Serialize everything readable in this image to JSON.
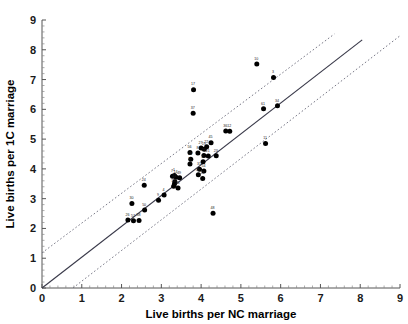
{
  "chart_data": {
    "type": "scatter",
    "title": "",
    "xlabel": "Live births per NC marriage",
    "ylabel": "Live births per 1C marriage",
    "xlim": [
      0,
      9
    ],
    "ylim": [
      0,
      9
    ],
    "xticks": [
      0,
      1,
      2,
      3,
      4,
      5,
      6,
      7,
      8,
      9
    ],
    "yticks": [
      0,
      1,
      2,
      3,
      4,
      5,
      6,
      7,
      8,
      9
    ],
    "xticklabels": [
      "0",
      "1",
      "2",
      "3",
      "4",
      "5",
      "6",
      "7",
      "8",
      "9"
    ],
    "yticklabels": [
      "0",
      "1",
      "2",
      "3",
      "4",
      "5",
      "6",
      "7",
      "8",
      "9"
    ],
    "minor_ticks_per_interval": 5,
    "grid": false,
    "legend": null,
    "marker": "filled-circle",
    "marker_color": "#000000",
    "point_label_position": "above-left",
    "points": [
      {
        "label": "10",
        "x": 5.4,
        "y": 7.52
      },
      {
        "label": "3",
        "x": 5.82,
        "y": 7.07
      },
      {
        "label": "17",
        "x": 3.81,
        "y": 6.66
      },
      {
        "label": "37",
        "x": 3.8,
        "y": 5.87
      },
      {
        "label": "61",
        "x": 5.57,
        "y": 6.02
      },
      {
        "label": "34",
        "x": 5.92,
        "y": 6.12
      },
      {
        "label": "36",
        "x": 4.62,
        "y": 5.27
      },
      {
        "label": "12",
        "x": 4.72,
        "y": 5.26
      },
      {
        "label": "11",
        "x": 5.62,
        "y": 4.85
      },
      {
        "label": "45",
        "x": 4.25,
        "y": 4.88
      },
      {
        "label": "22",
        "x": 4.14,
        "y": 4.74
      },
      {
        "label": "27",
        "x": 4.0,
        "y": 4.7
      },
      {
        "label": "19",
        "x": 4.08,
        "y": 4.66
      },
      {
        "label": "56",
        "x": 3.72,
        "y": 4.55
      },
      {
        "label": "8",
        "x": 3.92,
        "y": 4.53
      },
      {
        "label": "25",
        "x": 4.07,
        "y": 4.45
      },
      {
        "label": "21",
        "x": 4.18,
        "y": 4.43
      },
      {
        "label": "23",
        "x": 4.38,
        "y": 4.44
      },
      {
        "label": "29",
        "x": 3.74,
        "y": 4.32
      },
      {
        "label": "2",
        "x": 4.05,
        "y": 4.24
      },
      {
        "label": "5",
        "x": 3.72,
        "y": 4.16
      },
      {
        "label": "31",
        "x": 3.96,
        "y": 3.99
      },
      {
        "label": "54",
        "x": 4.07,
        "y": 3.93
      },
      {
        "label": "39",
        "x": 3.93,
        "y": 3.8
      },
      {
        "label": "28",
        "x": 4.04,
        "y": 3.68
      },
      {
        "label": "1",
        "x": 3.33,
        "y": 3.78
      },
      {
        "label": "7",
        "x": 3.28,
        "y": 3.75
      },
      {
        "label": "14",
        "x": 3.37,
        "y": 3.72
      },
      {
        "label": "49",
        "x": 3.46,
        "y": 3.7
      },
      {
        "label": "43",
        "x": 3.34,
        "y": 3.57
      },
      {
        "label": "6",
        "x": 3.33,
        "y": 3.49
      },
      {
        "label": "15",
        "x": 3.31,
        "y": 3.42
      },
      {
        "label": "35",
        "x": 3.42,
        "y": 3.36
      },
      {
        "label": "24",
        "x": 2.57,
        "y": 3.45
      },
      {
        "label": "4",
        "x": 3.07,
        "y": 3.12
      },
      {
        "label": "9",
        "x": 2.93,
        "y": 2.95
      },
      {
        "label": "30",
        "x": 2.26,
        "y": 2.84
      },
      {
        "label": "50",
        "x": 2.58,
        "y": 2.62
      },
      {
        "label": "26",
        "x": 2.16,
        "y": 2.28
      },
      {
        "label": "57",
        "x": 2.3,
        "y": 2.26
      },
      {
        "label": "58",
        "x": 2.44,
        "y": 2.27
      },
      {
        "label": "48",
        "x": 4.3,
        "y": 2.51
      }
    ],
    "fit_line": {
      "style": "solid",
      "color": "#3a3a4a",
      "intercept": 0.0,
      "slope": 1.035,
      "x_start": 0.0,
      "x_end": 8.05
    },
    "bands": [
      {
        "name": "upper-prediction-band",
        "style": "dotted",
        "color": "#7a7a88",
        "intercept": 1.18,
        "slope": 1.0,
        "x_start": 0.0,
        "x_end": 7.35
      },
      {
        "name": "lower-prediction-band",
        "style": "dotted",
        "color": "#7a7a88",
        "intercept": -0.8,
        "slope": 1.03,
        "x_start": 0.78,
        "x_end": 9.0
      }
    ]
  }
}
